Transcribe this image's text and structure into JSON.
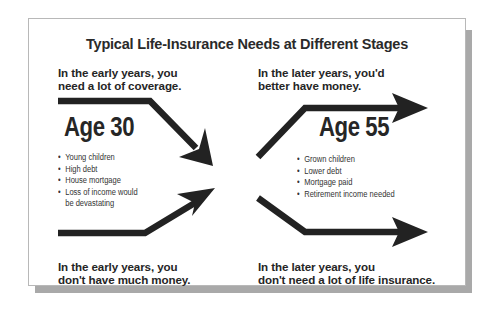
{
  "title": "Typical Life-Insurance Needs at Different Stages",
  "colors": {
    "ink": "#252525",
    "arrow": "#222222",
    "card_border": "#b8b8b8",
    "shadow": "#a9a9a9",
    "background": "#ffffff"
  },
  "left": {
    "age_label": "Age 30",
    "top_caption": {
      "line1": "In the early years, you",
      "line2": "need a lot of coverage."
    },
    "bottom_caption": {
      "line1": "In the early years, you",
      "line2": "don't have much money."
    },
    "bullet_glyph": "•",
    "bullets": [
      "Young children",
      "High debt",
      "House mortgage",
      "Loss of income would",
      "be devastating"
    ],
    "arrows": [
      {
        "name": "coverage-need-arrow",
        "direction": "down-right",
        "meaning": "need high coverage"
      },
      {
        "name": "money-arrow",
        "direction": "up-right",
        "meaning": "low money"
      }
    ]
  },
  "right": {
    "age_label": "Age 55",
    "top_caption": {
      "line1": "In the later years, you'd",
      "line2": "better have money."
    },
    "bottom_caption": {
      "line1": "In the later years, you",
      "line2": "don't need a lot of life insurance."
    },
    "bullet_glyph": "•",
    "bullets": [
      "Grown children",
      "Lower debt",
      "Mortgage paid",
      "Retirement income needed"
    ],
    "arrows": [
      {
        "name": "money-arrow",
        "direction": "up-then-right",
        "meaning": "money should be high"
      },
      {
        "name": "coverage-need-arrow",
        "direction": "down-then-right",
        "meaning": "coverage need low"
      }
    ]
  }
}
